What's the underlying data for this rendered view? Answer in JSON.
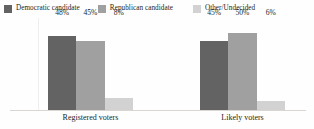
{
  "chart_data": {
    "type": "bar",
    "title": "",
    "subtitle": "",
    "xlabel": "",
    "ylabel": "",
    "ylim": [
      0,
      60
    ],
    "grid": false,
    "legend_position": "top",
    "categories": [
      "Registered voters",
      "Likely voters"
    ],
    "series": [
      {
        "name": "Democratic candidate",
        "color": "#636363",
        "values": [
          48,
          45
        ],
        "labels": [
          "48%",
          "45%"
        ]
      },
      {
        "name": "Republican candidate",
        "color": "#a0a0a0",
        "values": [
          45,
          50
        ],
        "labels": [
          "45%",
          "50%"
        ]
      },
      {
        "name": "Other/Undecided",
        "color": "#d2d2d2",
        "values": [
          8,
          6
        ],
        "labels": [
          "8%",
          "6%"
        ]
      }
    ]
  },
  "legend": {
    "items": [
      {
        "label": "Democratic candidate",
        "color": "#636363"
      },
      {
        "label": "Republican candidate",
        "color": "#a0a0a0"
      },
      {
        "label": "Other/Undecided",
        "color": "#d2d2d2"
      }
    ]
  },
  "axis": {
    "categories": [
      "Registered voters",
      "Likely voters"
    ]
  },
  "colors": {
    "background": "#fefefe",
    "text": "#231f20",
    "axis": "#d9d6d2"
  }
}
